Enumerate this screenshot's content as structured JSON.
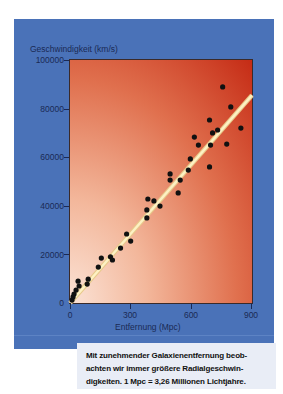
{
  "chart_data": {
    "type": "scatter",
    "title": "",
    "xlabel": "Entfernung (Mpc)",
    "ylabel": "Geschwindigkeit (km/s)",
    "xlim": [
      0,
      900
    ],
    "ylim": [
      0,
      100000
    ],
    "x_ticks": [
      0,
      300,
      600,
      900
    ],
    "x_tick_labels": [
      "0",
      "300",
      "600",
      "900"
    ],
    "y_ticks": [
      0,
      20000,
      40000,
      60000,
      80000,
      100000
    ],
    "y_tick_labels": [
      "0",
      "20000",
      "40000",
      "60000",
      "80000",
      "100000"
    ],
    "grid": false,
    "legend": null,
    "series": [
      {
        "name": "Galaxien",
        "type": "scatter",
        "color": "#111111",
        "x": [
          10,
          15,
          20,
          30,
          40,
          45,
          85,
          90,
          140,
          155,
          200,
          210,
          250,
          280,
          300,
          380,
          380,
          385,
          415,
          445,
          495,
          495,
          535,
          545,
          585,
          595,
          615,
          635,
          690,
          695,
          705,
          690,
          730,
          775,
          755,
          795,
          845
        ],
        "y": [
          1200,
          2500,
          3700,
          5300,
          9000,
          7000,
          7800,
          9800,
          14800,
          18500,
          19000,
          17700,
          22600,
          28400,
          25500,
          35000,
          38300,
          42800,
          42000,
          39900,
          53100,
          50600,
          45300,
          50600,
          54700,
          59300,
          68300,
          65000,
          56000,
          65000,
          70000,
          75300,
          71200,
          65400,
          88900,
          80700,
          72000
        ]
      },
      {
        "name": "Ausgleichsgerade",
        "type": "line",
        "color": "#fdf1c4",
        "x": [
          0,
          900
        ],
        "y": [
          0,
          85500
        ]
      }
    ]
  },
  "labels": {
    "y_axis_title": "Geschwindigkeit (km/s)",
    "x_axis_title": "Entfernung (Mpc)",
    "y_ticks": [
      "100000",
      "80000",
      "60000",
      "40000",
      "20000",
      "0"
    ],
    "x_ticks": [
      "0",
      "300",
      "600",
      "900"
    ]
  },
  "caption": {
    "line1": "Mit zunehmender Galaxienentfernung beob-",
    "line2": "achten wir immer größere Radialgeschwin-",
    "line3": "digkeiten. 1 Mpc = 3,26 Millionen Lichtjahre."
  },
  "colors": {
    "panel": "#4a72b8",
    "plot_light": "#fbe3d6",
    "plot_dark": "#c52b15",
    "regression_line": "#fdf1c4",
    "points": "#111111",
    "caption_bg": "#e9edf6"
  }
}
